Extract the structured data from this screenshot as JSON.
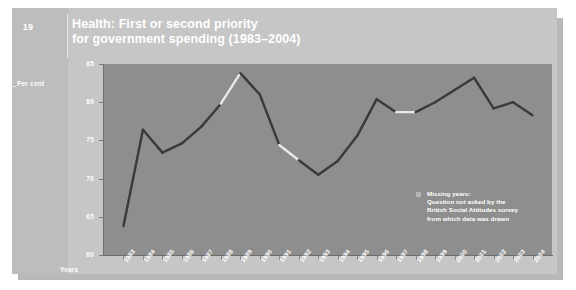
{
  "page": {
    "number": "19"
  },
  "header": {
    "title_line1": "Health: First or second priority",
    "title_line2": "for government spending (1983–2004)"
  },
  "axes": {
    "ylabel": "Per cent",
    "xlabel": "Years",
    "yticks": [
      "85",
      "80",
      "75",
      "70",
      "65",
      "60"
    ]
  },
  "legend": {
    "swatch_label": "missing-years-swatch",
    "line1": "Missing years:",
    "line2": "Question not asked by the",
    "line3": "British Social Attitudes survey",
    "line4": "from which data was drawn"
  },
  "colors": {
    "plot_background": "#8e8e8e",
    "panel_background": "#c6c6c6",
    "line": "#3a3a3a",
    "missing_line": "#e8e8e8",
    "text": "#ffffff"
  },
  "chart_data": {
    "type": "line",
    "title": "Health: First or second priority for government spending (1983–2004)",
    "xlabel": "Years",
    "ylabel": "Per cent",
    "ylim": [
      60,
      85
    ],
    "grid": false,
    "legend_position": "inside-bottom-right",
    "categories": [
      "1983",
      "1984",
      "1985",
      "1986",
      "1987",
      "1988",
      "1989",
      "1990",
      "1991",
      "1992",
      "1993",
      "1994",
      "1995",
      "1996",
      "1997",
      "1998",
      "1999",
      "2000",
      "2001",
      "2002",
      "2003",
      "2004"
    ],
    "values": [
      63.8,
      76.4,
      73.4,
      74.6,
      76.8,
      79.8,
      83.8,
      81.0,
      74.4,
      72.4,
      70.5,
      72.3,
      75.6,
      80.4,
      78.7,
      78.7,
      80.0,
      81.6,
      83.2,
      79.2,
      80.0,
      78.3
    ],
    "missing_segments": [
      [
        "1988",
        "1989"
      ],
      [
        "1991",
        "1992"
      ],
      [
        "1997",
        "1998"
      ]
    ],
    "missing_note": "Missing years: Question not asked by the British Social Attitudes survey from which data was drawn"
  }
}
